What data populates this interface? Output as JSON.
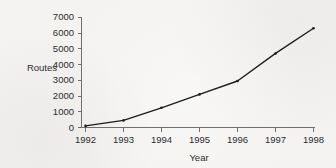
{
  "chart_data": {
    "type": "line",
    "title": "",
    "xlabel": "Year",
    "ylabel": "Routes",
    "categories": [
      "1992",
      "1993",
      "1994",
      "1995",
      "1996",
      "1997",
      "1998"
    ],
    "x": [
      1992,
      1993,
      1994,
      1995,
      1996,
      1997,
      1998
    ],
    "values": [
      100,
      450,
      1250,
      2100,
      2950,
      4700,
      6300
    ],
    "series": [
      {
        "name": "Routes",
        "values": [
          100,
          450,
          1250,
          2100,
          2950,
          4700,
          6300
        ]
      }
    ],
    "xlim": [
      1992,
      1998
    ],
    "ylim": [
      0,
      7000
    ],
    "ytick_labels": [
      "0",
      "1000",
      "2000",
      "3000",
      "4000",
      "5000",
      "6000",
      "7000"
    ],
    "ytick_values": [
      0,
      1000,
      2000,
      3000,
      4000,
      5000,
      6000,
      7000
    ],
    "xtick_labels": [
      "1992",
      "1993",
      "1994",
      "1995",
      "1996",
      "1997",
      "1998"
    ],
    "grid": false,
    "legend": false,
    "legend_position": "none",
    "line_color": "#1d1d1d",
    "axis_color": "#6f6f6f",
    "text_color": "#2c2c2c",
    "background_color": "#f4f3f1"
  }
}
